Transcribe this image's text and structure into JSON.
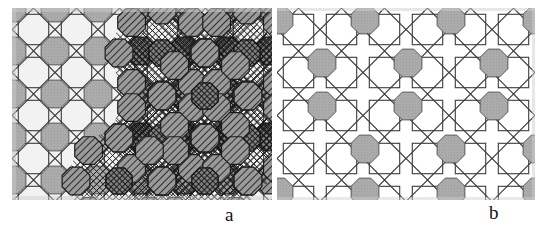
{
  "figure": {
    "width": 544,
    "height": 238,
    "background": "#ffffff"
  },
  "panels": [
    {
      "id": "a",
      "caption": "a",
      "x": 12,
      "y": 8,
      "width": 260,
      "height": 192,
      "tiling": {
        "type": "star-and-square",
        "cell": 43,
        "line_color": "#3c3c3c",
        "line_width": 1.1
      },
      "discs": {
        "radius": 15,
        "plain_fill": "#a9a9a9",
        "plain_stroke": "#555555",
        "hatched_fill": "#8c8c8c",
        "hatched_stroke": "#1e1e1e",
        "coverage": "dense",
        "note": "left half plain grey discs, right half hatched discs forming cross-hatched rosettes"
      },
      "hatching": {
        "angle_deg": 45,
        "spacing": 3,
        "color": "#1a1a1a"
      }
    },
    {
      "id": "b",
      "caption": "b",
      "x": 277,
      "y": 8,
      "width": 258,
      "height": 192,
      "tiling": {
        "type": "star-and-square",
        "cell": 43,
        "line_color": "#3c3c3c",
        "line_width": 1.1
      },
      "discs": {
        "radius": 15,
        "plain_fill": "#a9a9a9",
        "plain_stroke": "#555555",
        "coverage": "sparse",
        "lattice_step": 86,
        "note": "every fourth star centre carries a grey disc"
      }
    }
  ],
  "captions": {
    "a": "a",
    "b": "b"
  },
  "colors": {
    "background": "#ffffff",
    "line": "#3c3c3c",
    "disc_grey": "#a9a9a9",
    "disc_dark": "#8c8c8c",
    "hatch": "#1a1a1a",
    "caption": "#111111"
  }
}
